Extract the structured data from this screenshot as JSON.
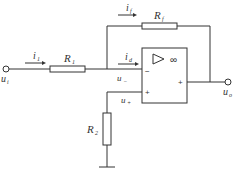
{
  "diagram": {
    "type": "inverting-amplifier-circuit",
    "labels": {
      "input_current": {
        "main": "i",
        "sub": "1"
      },
      "feedback_current": {
        "main": "i",
        "sub": "f"
      },
      "diff_current": {
        "main": "i",
        "sub": "d"
      },
      "r1": {
        "main": "R",
        "sub": "1"
      },
      "rf": {
        "main": "R",
        "sub": "f"
      },
      "r2": {
        "main": "R",
        "sub": "2"
      },
      "input_voltage": {
        "main": "u",
        "sub": "i"
      },
      "output_voltage": {
        "main": "u",
        "sub": "o"
      },
      "minus_voltage": {
        "main": "u",
        "sub": "−"
      },
      "plus_voltage": {
        "main": "u",
        "sub": "+"
      }
    },
    "opamp": {
      "gain_symbol": "∞",
      "minus_sign": "−",
      "plus_sign": "+",
      "output_sign": "+"
    }
  }
}
